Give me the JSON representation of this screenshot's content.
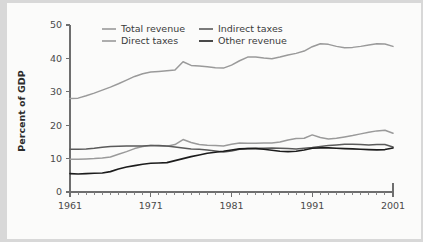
{
  "chart_data": {
    "type": "line",
    "title": "",
    "xlabel": "",
    "ylabel": "Percent of GDP",
    "xlim": [
      1961,
      2001
    ],
    "ylim": [
      0,
      50
    ],
    "yticks": [
      0,
      10,
      20,
      30,
      40,
      50
    ],
    "ytick_labels": [
      "0",
      "10",
      "20",
      "30",
      "40",
      "50"
    ],
    "xticks": [
      1961,
      1971,
      1981,
      1991,
      2001
    ],
    "xtick_labels": [
      "1961",
      "1971",
      "1981",
      "1991",
      "2001"
    ],
    "x_minor_tick_interval": 1,
    "grid": false,
    "legend_position": "top-center-inside",
    "x": [
      1961,
      1962,
      1963,
      1964,
      1965,
      1966,
      1967,
      1968,
      1969,
      1970,
      1971,
      1972,
      1973,
      1974,
      1975,
      1976,
      1977,
      1978,
      1979,
      1980,
      1981,
      1982,
      1983,
      1984,
      1985,
      1986,
      1987,
      1988,
      1989,
      1990,
      1991,
      1992,
      1993,
      1994,
      1995,
      1996,
      1997,
      1998,
      1999,
      2000,
      2001
    ],
    "series": [
      {
        "name": "Total revenue",
        "color": "#9a9a9a",
        "width": 1.5,
        "values": [
          28.0,
          28.1,
          28.8,
          29.6,
          30.5,
          31.4,
          32.4,
          33.5,
          34.6,
          35.4,
          35.9,
          36.1,
          36.3,
          36.5,
          39.0,
          37.9,
          37.7,
          37.5,
          37.2,
          37.1,
          38.0,
          39.3,
          40.4,
          40.4,
          40.1,
          39.9,
          40.4,
          41.0,
          41.5,
          42.2,
          43.5,
          44.4,
          44.2,
          43.6,
          43.2,
          43.3,
          43.6,
          44.0,
          44.4,
          44.3,
          43.6
        ]
      },
      {
        "name": "Direct taxes",
        "color": "#9a9a9a",
        "width": 1.5,
        "values": [
          9.8,
          9.8,
          9.9,
          10.0,
          10.2,
          10.5,
          11.3,
          12.1,
          13.0,
          13.6,
          13.9,
          13.8,
          13.7,
          14.2,
          15.7,
          14.8,
          14.2,
          14.0,
          13.9,
          13.8,
          14.3,
          14.7,
          14.6,
          14.6,
          14.7,
          14.7,
          15.0,
          15.6,
          16.0,
          16.1,
          17.1,
          16.3,
          15.9,
          16.1,
          16.5,
          16.9,
          17.4,
          17.9,
          18.3,
          18.5,
          17.6
        ]
      },
      {
        "name": "Indirect taxes",
        "color": "#5a5a5a",
        "width": 1.5,
        "values": [
          12.8,
          12.8,
          12.9,
          13.1,
          13.4,
          13.6,
          13.7,
          13.8,
          13.8,
          13.8,
          13.9,
          13.9,
          13.8,
          13.5,
          13.2,
          12.9,
          12.8,
          12.6,
          12.3,
          12.0,
          12.3,
          12.8,
          13.0,
          13.1,
          13.1,
          13.2,
          13.1,
          13.0,
          12.9,
          13.1,
          13.3,
          13.6,
          13.9,
          14.1,
          14.3,
          14.3,
          14.2,
          14.1,
          14.2,
          14.2,
          13.5
        ]
      },
      {
        "name": "Other revenue",
        "color": "#1c1c1c",
        "width": 1.6,
        "values": [
          5.5,
          5.4,
          5.5,
          5.6,
          5.7,
          6.1,
          6.9,
          7.5,
          7.9,
          8.3,
          8.6,
          8.7,
          8.8,
          9.4,
          10.0,
          10.6,
          11.1,
          11.6,
          11.9,
          12.2,
          12.6,
          12.9,
          13.0,
          13.0,
          12.8,
          12.5,
          12.2,
          12.1,
          12.2,
          12.6,
          13.1,
          13.2,
          13.2,
          13.1,
          13.0,
          12.9,
          12.8,
          12.7,
          12.6,
          12.7,
          13.2
        ]
      }
    ],
    "legend_entries": [
      {
        "label": "Total revenue",
        "color": "#9a9a9a"
      },
      {
        "label": "Indirect taxes",
        "color": "#5a5a5a"
      },
      {
        "label": "Direct taxes",
        "color": "#9a9a9a"
      },
      {
        "label": "Other revenue",
        "color": "#1c1c1c"
      }
    ]
  }
}
